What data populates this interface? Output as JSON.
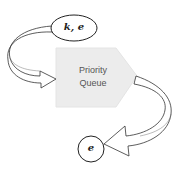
{
  "diagram": {
    "input_node": {
      "label": "k, e",
      "shape": "ellipse"
    },
    "queue_node": {
      "line1": "Priority",
      "line2": "Queue",
      "shape": "pentagon-arrow"
    },
    "output_node": {
      "label": "e",
      "shape": "circle"
    },
    "edges": [
      {
        "from": "input_node",
        "to": "queue_node",
        "style": "curved-block-arrow"
      },
      {
        "from": "queue_node",
        "to": "output_node",
        "style": "curved-block-arrow"
      }
    ],
    "colors": {
      "queue_fill": "#eeeeee",
      "arrow_fill": "#ffffff",
      "stroke": "#333333"
    }
  }
}
